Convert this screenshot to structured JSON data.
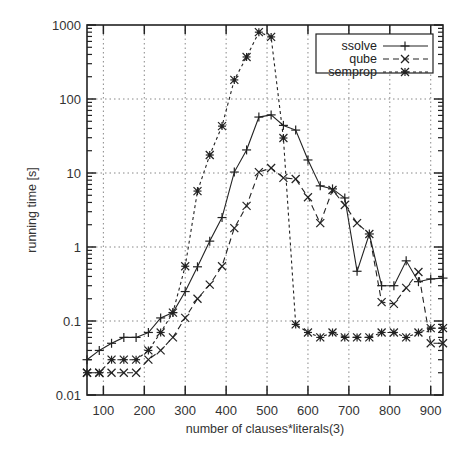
{
  "chart_data": {
    "type": "line",
    "title": "",
    "xlabel": "number of clauses*literals(3)",
    "ylabel": "running time [s]",
    "xlim": [
      60,
      930
    ],
    "ylim": [
      0.01,
      1000
    ],
    "yscale": "log",
    "grid": true,
    "legend_position": "top-right",
    "x_ticks": [
      100,
      200,
      300,
      400,
      500,
      600,
      700,
      800,
      900
    ],
    "x_tick_labels": [
      "100",
      "200",
      "300",
      "400",
      "500",
      "600",
      "700",
      "800",
      "900"
    ],
    "y_ticks": [
      0.01,
      0.1,
      1,
      10,
      100,
      1000
    ],
    "y_tick_labels": [
      "0.01",
      "0.1",
      "1",
      "10",
      "100",
      "1000"
    ],
    "x": [
      60,
      90,
      120,
      150,
      180,
      210,
      240,
      270,
      300,
      330,
      360,
      390,
      420,
      450,
      480,
      510,
      540,
      570,
      600,
      630,
      660,
      690,
      720,
      750,
      780,
      810,
      840,
      870,
      900,
      930
    ],
    "series": [
      {
        "name": "ssolve",
        "style": "solid",
        "marker": "plus",
        "values": [
          0.03,
          0.04,
          0.05,
          0.06,
          0.06,
          0.07,
          0.11,
          0.13,
          0.25,
          0.54,
          1.2,
          2.5,
          10.3,
          20.5,
          57,
          61,
          44,
          38,
          15,
          6.7,
          6.1,
          4.6,
          0.47,
          1.5,
          0.3,
          0.3,
          0.65,
          0.34,
          0.37,
          0.38
        ]
      },
      {
        "name": "qube",
        "style": "dashed",
        "marker": "cross",
        "values": [
          0.02,
          0.02,
          0.02,
          0.02,
          0.02,
          0.03,
          0.04,
          0.06,
          0.11,
          0.2,
          0.31,
          0.55,
          1.8,
          3.6,
          10.3,
          11.7,
          8.6,
          8.3,
          4.7,
          2.1,
          5.9,
          3.7,
          2.1,
          1.5,
          0.18,
          0.17,
          0.28,
          0.46,
          0.05,
          0.05
        ]
      },
      {
        "name": "semprop",
        "style": "dotted",
        "marker": "star",
        "values": [
          0.02,
          0.02,
          0.03,
          0.03,
          0.03,
          0.04,
          0.07,
          0.13,
          0.55,
          5.7,
          17.5,
          43,
          181,
          370,
          800,
          690,
          29.7,
          0.09,
          0.07,
          0.06,
          0.07,
          0.06,
          0.06,
          0.06,
          0.07,
          0.07,
          0.06,
          0.07,
          0.08,
          0.08
        ]
      }
    ]
  },
  "colors": {
    "axis": "#222222",
    "grid": "#888888",
    "series": "#222222",
    "background": "#ffffff"
  }
}
